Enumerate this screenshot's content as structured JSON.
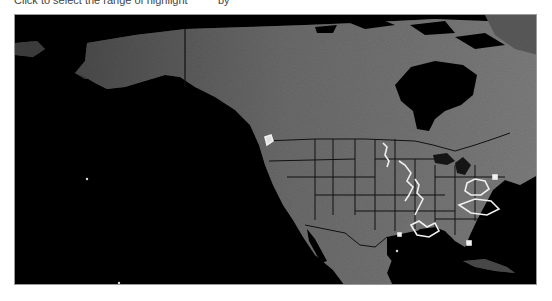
{
  "header": {
    "instruction_text": "Click to select the range of highlight",
    "instruction_suffix": "by",
    "range_slider": {
      "label": "range-slider"
    }
  },
  "map": {
    "title": "North America satellite view",
    "style": "grayscale satellite imagery with US state borders",
    "colors": {
      "ocean": "#000000",
      "land_dark": "#3a3a3a",
      "land_mid": "#5e5e5e",
      "land_light": "#8c8c8c",
      "borders": "#111111",
      "highlight": "#f0f0f0",
      "frame": "#9a9a9a"
    },
    "highlighted_regions": [
      "Washington (Puget Sound)",
      "Upper Mississippi River",
      "Illinois / Missouri river corridor",
      "Ohio River valley",
      "Virginia / West Virginia",
      "North Carolina",
      "Louisiana coast",
      "New Jersey coast",
      "South Florida"
    ]
  }
}
